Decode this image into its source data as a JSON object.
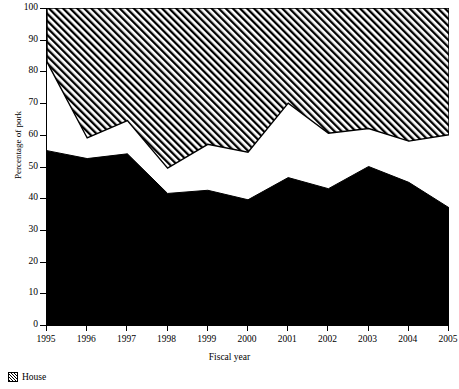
{
  "chart_data": {
    "type": "area",
    "title": "",
    "xlabel": "Fiscal year",
    "ylabel": "Percentage of pork",
    "x": [
      1995,
      1996,
      1997,
      1998,
      1999,
      2000,
      2001,
      2002,
      2003,
      2004,
      2005
    ],
    "categories": [
      "1995",
      "1996",
      "1997",
      "1998",
      "1999",
      "2000",
      "2001",
      "2002",
      "2003",
      "2004",
      "2005"
    ],
    "xlim": [
      1995,
      2005
    ],
    "ylim": [
      0,
      100
    ],
    "ytick_labels": [
      "0",
      "10",
      "20",
      "30",
      "40",
      "50",
      "60",
      "70",
      "80",
      "90",
      "100"
    ],
    "ytick_values": [
      0,
      10,
      20,
      30,
      40,
      50,
      60,
      70,
      80,
      90,
      100
    ],
    "grid": false,
    "legend_position": "below-left",
    "stacked": true,
    "series": [
      {
        "name": "Senate",
        "fill": "solid-black",
        "color": "#000000",
        "values": [
          55.0,
          52.5,
          54.0,
          41.5,
          42.5,
          39.5,
          46.5,
          43.0,
          50.0,
          45.0,
          37.0
        ]
      },
      {
        "name": "White gap",
        "fill": "white",
        "color": "#ffffff",
        "cumulative_top": [
          83.0,
          59.0,
          64.5,
          49.5,
          57.0,
          54.5,
          70.0,
          60.5,
          62.0,
          58.0,
          60.0
        ]
      },
      {
        "name": "House",
        "fill": "diagonal-hatch",
        "color": "#000000",
        "cumulative_bottom": [
          83.0,
          59.0,
          64.5,
          49.5,
          57.0,
          54.5,
          70.0,
          60.5,
          62.0,
          58.0,
          60.0
        ],
        "cumulative_top": [
          100,
          100,
          100,
          100,
          100,
          100,
          100,
          100,
          100,
          100,
          100
        ]
      }
    ],
    "legend": [
      {
        "label": "House",
        "swatch": "diagonal-hatch"
      }
    ]
  },
  "axes": {
    "y_title": "Percentage of pork",
    "x_title": "Fiscal year"
  },
  "legend": {
    "items": [
      {
        "label": "House"
      }
    ]
  }
}
